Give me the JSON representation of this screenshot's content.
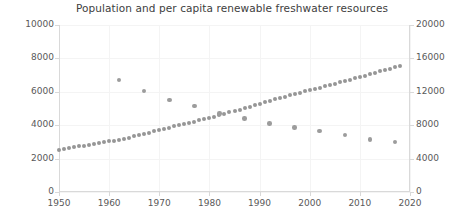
{
  "chart_data": {
    "type": "scatter",
    "title": "Population and per capita renewable freshwater resources",
    "xlabel": "",
    "ylabel": "",
    "grid": true,
    "legend": "none",
    "xlim": [
      1950,
      2020
    ],
    "xticks": [
      1950,
      1960,
      1970,
      1980,
      1990,
      2000,
      2010,
      2020
    ],
    "y_left": {
      "label": "Population (millions)",
      "lim": [
        0,
        10000
      ],
      "ticks": [
        0,
        2000,
        4000,
        6000,
        8000,
        10000
      ]
    },
    "y_right": {
      "label": "Per capita renewable freshwater resources (m3)",
      "lim": [
        0,
        20000
      ],
      "ticks": [
        0,
        4000,
        8000,
        12000,
        16000,
        20000
      ]
    },
    "series": [
      {
        "name": "Population",
        "axis": "left",
        "marker": "circle",
        "color": "#969696",
        "x": [
          1950,
          1951,
          1952,
          1953,
          1954,
          1955,
          1956,
          1957,
          1958,
          1959,
          1960,
          1961,
          1962,
          1963,
          1964,
          1965,
          1966,
          1967,
          1968,
          1969,
          1970,
          1971,
          1972,
          1973,
          1974,
          1975,
          1976,
          1977,
          1978,
          1979,
          1980,
          1981,
          1982,
          1983,
          1984,
          1985,
          1986,
          1987,
          1988,
          1989,
          1990,
          1991,
          1992,
          1993,
          1994,
          1995,
          1996,
          1997,
          1998,
          1999,
          2000,
          2001,
          2002,
          2003,
          2004,
          2005,
          2006,
          2007,
          2008,
          2009,
          2010,
          2011,
          2012,
          2013,
          2014,
          2015,
          2016,
          2017,
          2018
        ],
        "values": [
          2536,
          2584,
          2630,
          2677,
          2725,
          2773,
          2827,
          2882,
          2938,
          2995,
          3033,
          3073,
          3127,
          3193,
          3260,
          3329,
          3400,
          3473,
          3551,
          3631,
          3700,
          3775,
          3851,
          3926,
          4000,
          4073,
          4144,
          4216,
          4290,
          4366,
          4440,
          4516,
          4597,
          4679,
          4762,
          4845,
          4931,
          5021,
          5111,
          5201,
          5289,
          5376,
          5461,
          5545,
          5628,
          5709,
          5790,
          5870,
          5949,
          6028,
          6089,
          6167,
          6245,
          6323,
          6402,
          6481,
          6561,
          6642,
          6724,
          6806,
          6888,
          6970,
          7053,
          7136,
          7219,
          7302,
          7383,
          7464,
          7544
        ]
      },
      {
        "name": "Per capita renewable freshwater resources",
        "axis": "right",
        "marker": "circle",
        "color": "#9c9c9c",
        "x": [
          1962,
          1967,
          1972,
          1977,
          1982,
          1987,
          1992,
          1997,
          2002,
          2007,
          2012,
          2017
        ],
        "values": [
          13400,
          12100,
          11000,
          10300,
          9400,
          8800,
          8200,
          7700,
          7300,
          6800,
          6300,
          6000
        ]
      }
    ]
  }
}
